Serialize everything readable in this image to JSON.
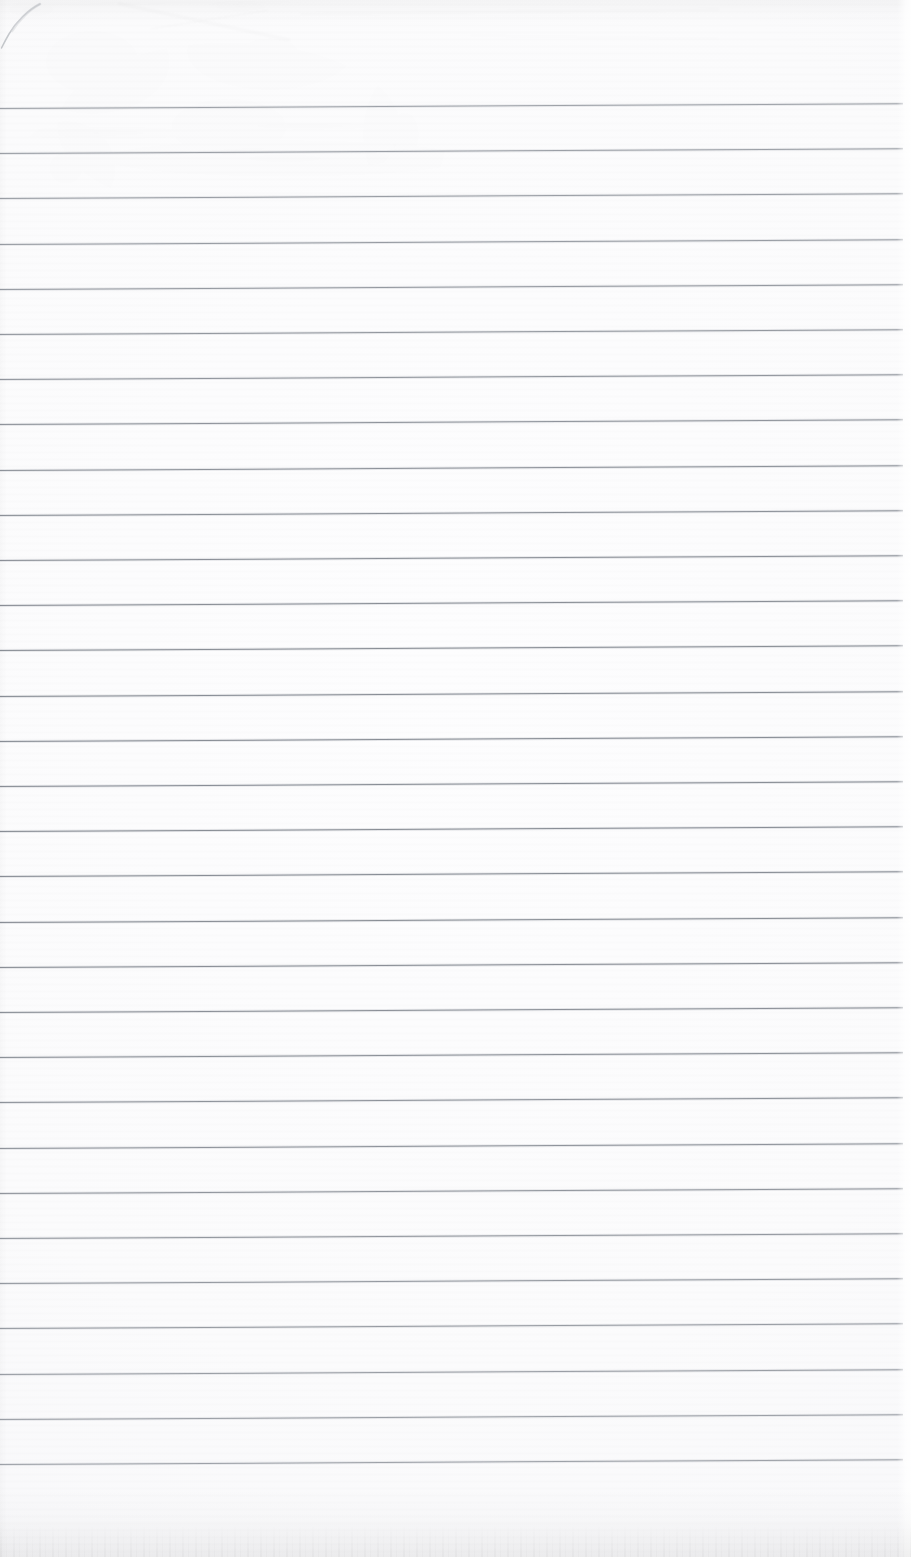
{
  "document": {
    "kind": "scanned-lined-paper",
    "title": "Blank ruled notebook page",
    "content_text": "",
    "is_blank": true,
    "page_width_px": 911,
    "page_height_px": 1557
  },
  "paper": {
    "background_color": "#fbfbfc",
    "highlight_color": "#fdfdfe",
    "shadow_color": "#f4f5f6",
    "edge_shadow_color": "#e9eaec"
  },
  "rules": {
    "count": 31,
    "color": "#8b9097",
    "thickness_px": 1,
    "spacing_px": 45.2,
    "first_line_y_px": 108,
    "last_line_y_px": 1465,
    "line_start_x_px": 0,
    "line_end_x_px": 903,
    "skew_degrees": -0.3,
    "y_positions": [
      108,
      153.2,
      198.4,
      243.6,
      288.8,
      334,
      379.2,
      424.4,
      469.6,
      514.8,
      560,
      605.2,
      650.4,
      695.6,
      740.8,
      786,
      831.2,
      876.4,
      921.6,
      966.8,
      1012,
      1057.2,
      1102.4,
      1147.6,
      1192.8,
      1238,
      1283.2,
      1328.4,
      1373.6,
      1418.8,
      1464
    ]
  },
  "marks": [
    {
      "name": "pen-arc-top-left",
      "kind": "ink-stroke",
      "description": "faint curved pen stroke in the upper-left corner",
      "color": "#c7cacd",
      "x_px": 0,
      "y_px": 0,
      "width_px": 48,
      "height_px": 52
    },
    {
      "name": "crease-top-left",
      "kind": "paper-crease",
      "description": "soft diagonal fold shadow near the top-left",
      "color": "#f0f1f2",
      "x_px": 120,
      "y_px": 4,
      "width_px": 170,
      "height_px": 60
    },
    {
      "name": "crease-top-center",
      "kind": "paper-crease",
      "description": "very faint horizontal scuff across the top margin",
      "color": "#f2f3f4",
      "x_px": 300,
      "y_px": 10,
      "width_px": 420,
      "height_px": 18
    }
  ]
}
